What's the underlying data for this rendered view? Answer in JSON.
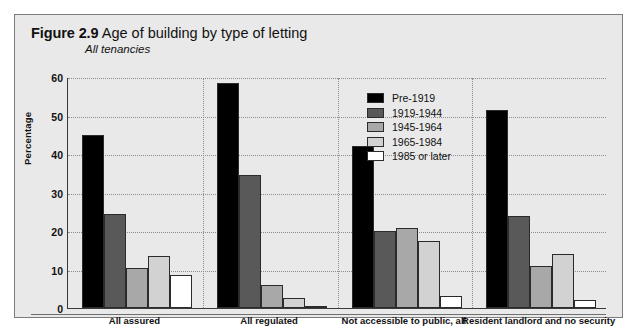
{
  "figure": {
    "number": "Figure 2.9",
    "title": "Age of building by type of letting",
    "subtitle": "All tenancies"
  },
  "colors": {
    "series_1": "#000000",
    "series_2": "#595959",
    "series_3": "#a8a8a8",
    "series_4": "#d2d2d2",
    "series_5": "#ffffff",
    "background": "#e9e9e9",
    "axis": "#3a3a3a",
    "grid": "#8e8e8e"
  },
  "legend": {
    "position": "inside-top-center-right",
    "items": [
      {
        "label": "Pre-1919",
        "color": "#000000"
      },
      {
        "label": "1919-1944",
        "color": "#595959"
      },
      {
        "label": "1945-1964",
        "color": "#a8a8a8"
      },
      {
        "label": "1965-1984",
        "color": "#d2d2d2"
      },
      {
        "label": "1985 or later",
        "color": "#ffffff"
      }
    ]
  },
  "chart_data": {
    "type": "bar",
    "title": "Age of building by type of letting",
    "subtitle": "All tenancies",
    "xlabel": "",
    "ylabel": "Percentage",
    "ylim": [
      0,
      60
    ],
    "yticks": [
      0,
      10,
      20,
      30,
      40,
      50,
      60
    ],
    "grid": true,
    "legend_position": "inside top right",
    "categories": [
      "All assured",
      "All regulated",
      "Not accessible to public, all",
      "Resident landlord and no security"
    ],
    "series": [
      {
        "name": "Pre-1919",
        "color": "#000000",
        "values": [
          45,
          58.5,
          42,
          51.5
        ]
      },
      {
        "name": "1919-1944",
        "color": "#595959",
        "values": [
          24.5,
          34.5,
          20,
          24
        ]
      },
      {
        "name": "1945-1964",
        "color": "#a8a8a8",
        "values": [
          10.5,
          6,
          20.8,
          11
        ]
      },
      {
        "name": "1965-1984",
        "color": "#d2d2d2",
        "values": [
          13.5,
          2.5,
          17.5,
          14
        ]
      },
      {
        "name": "1985 or later",
        "color": "#ffffff",
        "values": [
          8.5,
          0.3,
          3,
          2
        ]
      }
    ]
  }
}
